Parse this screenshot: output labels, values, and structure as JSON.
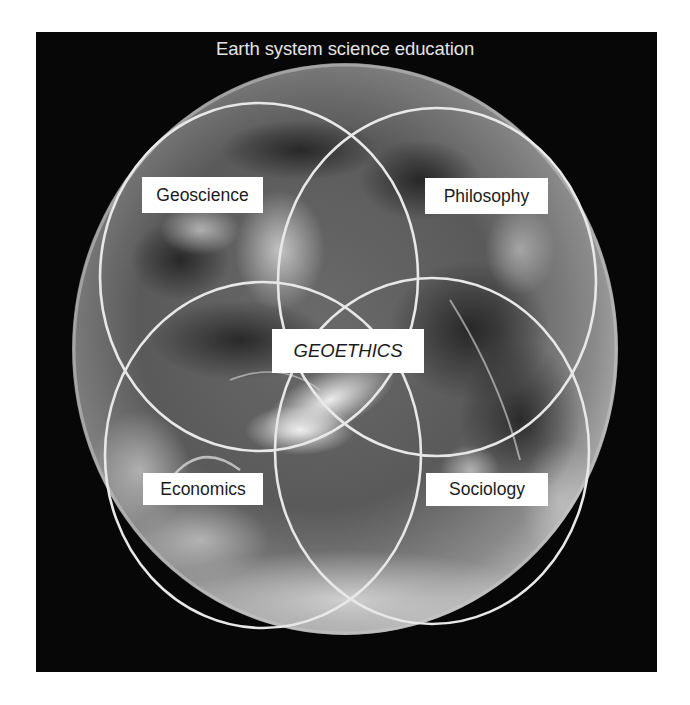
{
  "title": "Earth system science education",
  "diagram": {
    "type": "venn-overlay-on-globe",
    "background": "#070707",
    "circle_stroke": "#e8e8e8",
    "center_label": "GEOETHICS",
    "sets": [
      {
        "id": "geoscience",
        "label": "Geoscience",
        "position": "top-left"
      },
      {
        "id": "philosophy",
        "label": "Philosophy",
        "position": "top-right"
      },
      {
        "id": "economics",
        "label": "Economics",
        "position": "bottom-left"
      },
      {
        "id": "sociology",
        "label": "Sociology",
        "position": "bottom-right"
      }
    ]
  }
}
